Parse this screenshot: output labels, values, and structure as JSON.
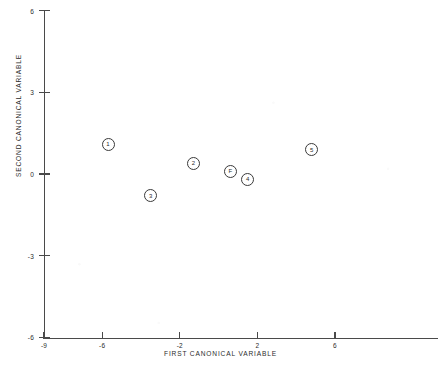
{
  "chart_data": {
    "type": "scatter",
    "title": "",
    "subtitle": "",
    "xlabel": "FIRST CANONICAL VARIABLE",
    "ylabel": "SECOND CANONICAL VARIABLE",
    "xlim": [
      -9,
      9
    ],
    "ylim": [
      -6,
      6
    ],
    "xticks": [
      -9,
      -6,
      -2,
      2,
      6
    ],
    "xticklabels": [
      "-9",
      "-6",
      "-2",
      "2",
      "6"
    ],
    "yticks": [
      6,
      3,
      0,
      -3,
      -6
    ],
    "yticklabels": [
      "6",
      "3",
      "0",
      "-3",
      "-6"
    ],
    "grid": false,
    "legend": null,
    "marker_style": "circled-label",
    "points": [
      {
        "label": "1",
        "x": -5.7,
        "y": 1.1
      },
      {
        "label": "3",
        "x": -3.5,
        "y": -0.8
      },
      {
        "label": "2",
        "x": -1.3,
        "y": 0.4
      },
      {
        "label": "F",
        "x": 0.6,
        "y": 0.1
      },
      {
        "label": "4",
        "x": 1.5,
        "y": -0.2
      },
      {
        "label": "5",
        "x": 4.8,
        "y": 0.9
      }
    ],
    "colors": {
      "axis": "#4a4a4a",
      "text": "#2b2b2b",
      "marker_stroke": "#3a3a3a",
      "marker_fill": "#ffffff",
      "background": "#ffffff"
    }
  }
}
